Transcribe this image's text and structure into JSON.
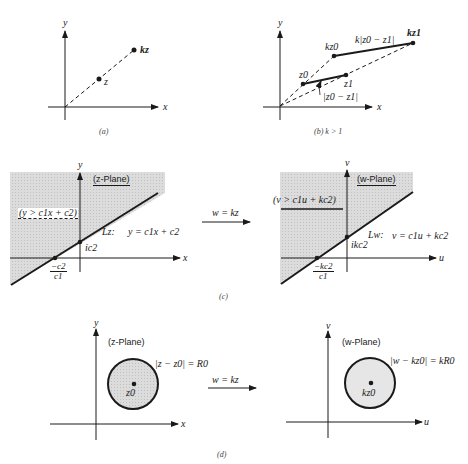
{
  "panels": {
    "a": {
      "caption": "(a)",
      "axis_x": "x",
      "axis_y": "y",
      "point_z": "z",
      "point_kz": "kz"
    },
    "b": {
      "caption": "(b)  k > 1",
      "axis_x": "x",
      "axis_y": "y",
      "point_z0": "z0",
      "point_z1": "z1",
      "point_kz0": "kz0",
      "point_kz1": "kz1",
      "segment_label": "|z0 − z1|",
      "scaled_segment_label": "k|z0 − z1|"
    },
    "c": {
      "caption": "(c)",
      "map_label": "w = kz",
      "left": {
        "plane_label": "(z-Plane)",
        "axis_x": "x",
        "axis_y": "y",
        "region_label": "(y > c1x + c2)",
        "line_name": "Lz:",
        "line_eq": "y = c1x + c2",
        "intercept_y": "ic2",
        "intercept_x_num": "−c2",
        "intercept_x_den": "c1"
      },
      "right": {
        "plane_label": "(w-Plane)",
        "axis_x": "u",
        "axis_y": "v",
        "region_label": "(v > c1u + kc2)",
        "line_name": "Lw:",
        "line_eq": "v = c1u + kc2",
        "intercept_y": "ikc2",
        "intercept_x_num": "−kc2",
        "intercept_x_den": "c1"
      }
    },
    "d": {
      "caption": "(d)",
      "map_label": "w = kz",
      "left": {
        "plane_label": "(z-Plane)",
        "axis_x": "x",
        "axis_y": "y",
        "circle_eq": "|z − z0| = R0",
        "center": "z0"
      },
      "right": {
        "plane_label": "(w-Plane)",
        "axis_x": "u",
        "axis_y": "v",
        "circle_eq": "|w − kz0| = kR0",
        "center": "kz0"
      }
    }
  },
  "colors": {
    "ink": "#1a1a1a",
    "shade": "#d9d9d9",
    "background": "#ffffff"
  }
}
